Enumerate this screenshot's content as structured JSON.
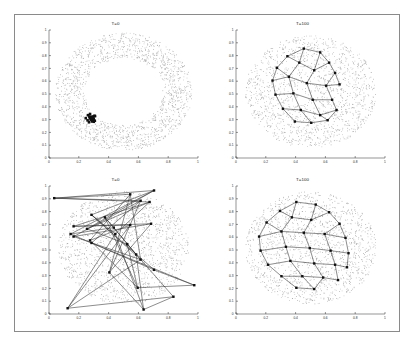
{
  "figure": {
    "background": "#ffffff",
    "border_color": "#8a8a8a",
    "layout": "2x2 grid of scatter/network panels"
  },
  "panels": [
    {
      "id": "top-left",
      "title": "T=0",
      "description": "Annulus of gray points with a tight black cluster of graph nodes collapsed near lower-left",
      "cloud_shape": "annulus",
      "cloud_color": "#b9b9b9",
      "node_color": "#111111",
      "edges_visible": false
    },
    {
      "id": "top-right",
      "title": "T=100",
      "description": "Polygonal mesh network of square nodes spread over a filled gray disk",
      "cloud_shape": "disk",
      "cloud_color": "#b9b9b9",
      "node_color": "#101010",
      "edges_visible": true
    },
    {
      "id": "bottom-left",
      "title": "T=0",
      "description": "Tangled random graph with long crossing edges over a filled gray disk",
      "cloud_shape": "disk",
      "cloud_color": "#b9b9b9",
      "node_color": "#101010",
      "edges_visible": true
    },
    {
      "id": "bottom-right",
      "title": "T=100",
      "description": "Relaxed lattice mesh filling a gray disk uniformly",
      "cloud_shape": "disk",
      "cloud_color": "#b9b9b9",
      "node_color": "#101010",
      "edges_visible": true
    }
  ],
  "chart_data": [
    {
      "type": "scatter",
      "panel": "top-left",
      "title": "T=0",
      "xlabel": "",
      "ylabel": "",
      "xlim": [
        0,
        1
      ],
      "ylim": [
        0,
        1
      ],
      "grid": false,
      "xticks": [
        0,
        0.2,
        0.4,
        0.6,
        0.8,
        1
      ],
      "xticklabels": [
        "0",
        "0.2",
        "0.4",
        "0.6",
        "0.8",
        "1"
      ],
      "yticks": [
        0,
        0.1,
        0.2,
        0.3,
        0.4,
        0.5,
        0.6,
        0.7,
        0.8,
        0.9,
        1
      ],
      "yticklabels": [
        "0",
        "0.1",
        "0.2",
        "0.3",
        "0.4",
        "0.5",
        "0.6",
        "0.7",
        "0.8",
        "0.9",
        "1"
      ],
      "series": [
        {
          "name": "background cloud",
          "marker": "dot",
          "color": "#b9b9b9",
          "shape": "annulus",
          "center": [
            0.5,
            0.52
          ],
          "inner_radius": 0.26,
          "outer_radius": 0.46,
          "n_points": 1600
        },
        {
          "name": "graph nodes",
          "marker": "square",
          "color": "#111111",
          "shape": "cluster",
          "center": [
            0.28,
            0.31
          ],
          "radius": 0.035,
          "n_points": 26
        }
      ]
    },
    {
      "type": "scatter",
      "panel": "top-right",
      "title": "T=100",
      "xlabel": "",
      "ylabel": "",
      "xlim": [
        0,
        1
      ],
      "ylim": [
        0,
        1
      ],
      "grid": false,
      "xticks": [
        0,
        0.2,
        0.4,
        0.6,
        0.8,
        1
      ],
      "xticklabels": [
        "0",
        "0.2",
        "0.4",
        "0.6",
        "0.8",
        "1"
      ],
      "yticks": [
        0,
        0.1,
        0.2,
        0.3,
        0.4,
        0.5,
        0.6,
        0.7,
        0.8,
        0.9,
        1
      ],
      "yticklabels": [
        "0",
        "0.1",
        "0.2",
        "0.3",
        "0.4",
        "0.5",
        "0.6",
        "0.7",
        "0.8",
        "0.9",
        "1"
      ],
      "series": [
        {
          "name": "background cloud",
          "marker": "dot",
          "color": "#b9b9b9",
          "shape": "disk",
          "center": [
            0.5,
            0.52
          ],
          "radius": 0.44,
          "n_points": 1500
        },
        {
          "name": "network nodes",
          "marker": "square",
          "color": "#101010",
          "points": [
            [
              0.455,
              0.855
            ],
            [
              0.565,
              0.825
            ],
            [
              0.345,
              0.795
            ],
            [
              0.625,
              0.745
            ],
            [
              0.275,
              0.705
            ],
            [
              0.425,
              0.745
            ],
            [
              0.525,
              0.685
            ],
            [
              0.665,
              0.665
            ],
            [
              0.245,
              0.605
            ],
            [
              0.355,
              0.635
            ],
            [
              0.475,
              0.585
            ],
            [
              0.605,
              0.565
            ],
            [
              0.695,
              0.575
            ],
            [
              0.265,
              0.495
            ],
            [
              0.385,
              0.505
            ],
            [
              0.515,
              0.455
            ],
            [
              0.645,
              0.455
            ],
            [
              0.315,
              0.385
            ],
            [
              0.435,
              0.375
            ],
            [
              0.565,
              0.335
            ],
            [
              0.675,
              0.375
            ],
            [
              0.395,
              0.285
            ],
            [
              0.505,
              0.275
            ],
            [
              0.615,
              0.295
            ]
          ]
        }
      ],
      "edges": [
        [
          0,
          1
        ],
        [
          0,
          2
        ],
        [
          0,
          5
        ],
        [
          1,
          3
        ],
        [
          1,
          6
        ],
        [
          2,
          4
        ],
        [
          2,
          5
        ],
        [
          3,
          6
        ],
        [
          3,
          7
        ],
        [
          4,
          8
        ],
        [
          4,
          9
        ],
        [
          5,
          6
        ],
        [
          5,
          9
        ],
        [
          6,
          10
        ],
        [
          7,
          12
        ],
        [
          7,
          11
        ],
        [
          8,
          13
        ],
        [
          8,
          9
        ],
        [
          9,
          10
        ],
        [
          9,
          14
        ],
        [
          10,
          11
        ],
        [
          10,
          15
        ],
        [
          11,
          12
        ],
        [
          11,
          16
        ],
        [
          13,
          14
        ],
        [
          13,
          17
        ],
        [
          14,
          15
        ],
        [
          14,
          18
        ],
        [
          15,
          16
        ],
        [
          15,
          19
        ],
        [
          16,
          20
        ],
        [
          17,
          18
        ],
        [
          17,
          21
        ],
        [
          18,
          19
        ],
        [
          18,
          22
        ],
        [
          19,
          20
        ],
        [
          19,
          23
        ],
        [
          21,
          22
        ],
        [
          22,
          23
        ],
        [
          20,
          23
        ]
      ]
    },
    {
      "type": "scatter",
      "panel": "bottom-left",
      "title": "T=0",
      "xlabel": "",
      "ylabel": "",
      "xlim": [
        0,
        1
      ],
      "ylim": [
        0,
        1
      ],
      "grid": false,
      "xticks": [
        0,
        0.2,
        0.4,
        0.6,
        0.8,
        1
      ],
      "xticklabels": [
        "0",
        "0.2",
        "0.4",
        "0.6",
        "0.8",
        "1"
      ],
      "yticks": [
        0,
        0.1,
        0.2,
        0.3,
        0.4,
        0.5,
        0.6,
        0.7,
        0.8,
        0.9,
        1
      ],
      "yticklabels": [
        "0",
        "0.1",
        "0.2",
        "0.3",
        "0.4",
        "0.5",
        "0.6",
        "0.7",
        "0.8",
        "0.9",
        "1"
      ],
      "series": [
        {
          "name": "background cloud",
          "marker": "dot",
          "color": "#b9b9b9",
          "shape": "disk",
          "center": [
            0.5,
            0.52
          ],
          "radius": 0.44,
          "n_points": 1500
        },
        {
          "name": "network nodes",
          "marker": "square",
          "color": "#101010",
          "points": [
            [
              0.035,
              0.905
            ],
            [
              0.705,
              0.965
            ],
            [
              0.545,
              0.935
            ],
            [
              0.615,
              0.885
            ],
            [
              0.675,
              0.875
            ],
            [
              0.285,
              0.775
            ],
            [
              0.375,
              0.755
            ],
            [
              0.165,
              0.685
            ],
            [
              0.255,
              0.665
            ],
            [
              0.435,
              0.675
            ],
            [
              0.545,
              0.695
            ],
            [
              0.685,
              0.705
            ],
            [
              0.145,
              0.625
            ],
            [
              0.165,
              0.605
            ],
            [
              0.275,
              0.575
            ],
            [
              0.285,
              0.555
            ],
            [
              0.445,
              0.625
            ],
            [
              0.525,
              0.545
            ],
            [
              0.585,
              0.465
            ],
            [
              0.615,
              0.425
            ],
            [
              0.405,
              0.325
            ],
            [
              0.705,
              0.345
            ],
            [
              0.975,
              0.225
            ],
            [
              0.595,
              0.205
            ],
            [
              0.125,
              0.045
            ],
            [
              0.635,
              0.035
            ],
            [
              0.835,
              0.135
            ]
          ]
        }
      ],
      "edges": [
        [
          0,
          1
        ],
        [
          0,
          2
        ],
        [
          0,
          3
        ],
        [
          0,
          4
        ],
        [
          1,
          5
        ],
        [
          1,
          8
        ],
        [
          1,
          12
        ],
        [
          2,
          14
        ],
        [
          2,
          20
        ],
        [
          3,
          13
        ],
        [
          3,
          15
        ],
        [
          4,
          7
        ],
        [
          4,
          8
        ],
        [
          4,
          16
        ],
        [
          5,
          19
        ],
        [
          5,
          21
        ],
        [
          6,
          18
        ],
        [
          6,
          23
        ],
        [
          7,
          10
        ],
        [
          7,
          11
        ],
        [
          8,
          17
        ],
        [
          9,
          12
        ],
        [
          9,
          18
        ],
        [
          10,
          14
        ],
        [
          10,
          24
        ],
        [
          11,
          13
        ],
        [
          11,
          20
        ],
        [
          12,
          21
        ],
        [
          13,
          19
        ],
        [
          14,
          23
        ],
        [
          15,
          22
        ],
        [
          16,
          24
        ],
        [
          16,
          25
        ],
        [
          17,
          23
        ],
        [
          17,
          26
        ],
        [
          18,
          25
        ],
        [
          19,
          24
        ],
        [
          20,
          25
        ],
        [
          21,
          22
        ],
        [
          22,
          23
        ],
        [
          24,
          26
        ],
        [
          25,
          26
        ],
        [
          6,
          9
        ],
        [
          5,
          16
        ],
        [
          3,
          20
        ],
        [
          2,
          19
        ]
      ]
    },
    {
      "type": "scatter",
      "panel": "bottom-right",
      "title": "T=100",
      "xlabel": "",
      "ylabel": "",
      "xlim": [
        0,
        1
      ],
      "ylim": [
        0,
        1
      ],
      "grid": false,
      "xticks": [
        0,
        0.2,
        0.4,
        0.6,
        0.8,
        1
      ],
      "xticklabels": [
        "0",
        "0.2",
        "0.4",
        "0.6",
        "0.8",
        "1"
      ],
      "yticks": [
        0,
        0.1,
        0.2,
        0.3,
        0.4,
        0.5,
        0.6,
        0.7,
        0.8,
        0.9,
        1
      ],
      "yticklabels": [
        "0",
        "0.1",
        "0.2",
        "0.3",
        "0.4",
        "0.5",
        "0.6",
        "0.7",
        "0.8",
        "0.9",
        "1"
      ],
      "series": [
        {
          "name": "background cloud",
          "marker": "dot",
          "color": "#b9b9b9",
          "shape": "disk",
          "center": [
            0.5,
            0.52
          ],
          "radius": 0.44,
          "n_points": 1500
        },
        {
          "name": "network nodes",
          "marker": "square",
          "color": "#101010",
          "points": [
            [
              0.405,
              0.875
            ],
            [
              0.535,
              0.855
            ],
            [
              0.295,
              0.805
            ],
            [
              0.625,
              0.795
            ],
            [
              0.205,
              0.715
            ],
            [
              0.375,
              0.755
            ],
            [
              0.505,
              0.735
            ],
            [
              0.695,
              0.705
            ],
            [
              0.155,
              0.605
            ],
            [
              0.305,
              0.645
            ],
            [
              0.455,
              0.635
            ],
            [
              0.595,
              0.625
            ],
            [
              0.735,
              0.595
            ],
            [
              0.165,
              0.495
            ],
            [
              0.335,
              0.525
            ],
            [
              0.495,
              0.515
            ],
            [
              0.635,
              0.495
            ],
            [
              0.755,
              0.475
            ],
            [
              0.215,
              0.385
            ],
            [
              0.365,
              0.415
            ],
            [
              0.525,
              0.395
            ],
            [
              0.665,
              0.385
            ],
            [
              0.745,
              0.365
            ],
            [
              0.305,
              0.295
            ],
            [
              0.445,
              0.295
            ],
            [
              0.585,
              0.285
            ],
            [
              0.685,
              0.265
            ],
            [
              0.405,
              0.205
            ],
            [
              0.525,
              0.195
            ]
          ]
        }
      ],
      "edges": [
        [
          0,
          1
        ],
        [
          0,
          2
        ],
        [
          0,
          5
        ],
        [
          1,
          3
        ],
        [
          1,
          6
        ],
        [
          2,
          4
        ],
        [
          2,
          5
        ],
        [
          3,
          6
        ],
        [
          3,
          7
        ],
        [
          4,
          8
        ],
        [
          4,
          9
        ],
        [
          5,
          6
        ],
        [
          5,
          9
        ],
        [
          6,
          10
        ],
        [
          7,
          11
        ],
        [
          7,
          12
        ],
        [
          8,
          13
        ],
        [
          8,
          9
        ],
        [
          9,
          10
        ],
        [
          9,
          14
        ],
        [
          10,
          11
        ],
        [
          10,
          15
        ],
        [
          11,
          12
        ],
        [
          11,
          16
        ],
        [
          12,
          17
        ],
        [
          13,
          14
        ],
        [
          13,
          18
        ],
        [
          14,
          15
        ],
        [
          14,
          19
        ],
        [
          15,
          16
        ],
        [
          15,
          20
        ],
        [
          16,
          17
        ],
        [
          16,
          21
        ],
        [
          17,
          22
        ],
        [
          18,
          19
        ],
        [
          18,
          23
        ],
        [
          19,
          20
        ],
        [
          19,
          24
        ],
        [
          20,
          21
        ],
        [
          20,
          25
        ],
        [
          21,
          22
        ],
        [
          21,
          26
        ],
        [
          23,
          24
        ],
        [
          23,
          27
        ],
        [
          24,
          25
        ],
        [
          24,
          28
        ],
        [
          25,
          26
        ],
        [
          25,
          28
        ],
        [
          27,
          28
        ]
      ]
    }
  ]
}
